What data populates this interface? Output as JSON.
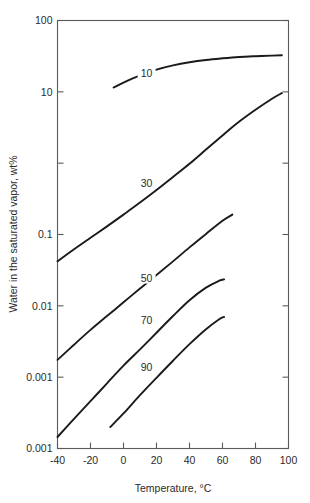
{
  "chart_data": {
    "type": "line",
    "title": "",
    "xlabel": "Temperature, °C",
    "ylabel": "Water in the saturated vapor, wt%",
    "xlim": [
      -40,
      100
    ],
    "ylim": [
      0.0001,
      100
    ],
    "yscale": "log",
    "xscale": "linear",
    "grid": false,
    "legend": "inline-curve-labels",
    "xticks": [
      -40,
      -20,
      0,
      20,
      40,
      60,
      80,
      100
    ],
    "xtick_labels": [
      "-40",
      "-20",
      "0",
      "20",
      "40",
      "60",
      "80",
      "100"
    ],
    "yticks": [
      100,
      10,
      1,
      0.1,
      0.01,
      0.001,
      0.0001
    ],
    "ytick_labels": [
      "100",
      "10",
      "",
      "0.1",
      "0.01",
      "0.001",
      "0.001"
    ],
    "ytick_label_note": "The 1 decade label is blank and the lowest decade is printed as 0.001 in the source figure",
    "series": [
      {
        "name": "10",
        "label": "10",
        "label_x": 14,
        "label_y": 18.0,
        "points": [
          {
            "x": -6,
            "y": 11.5
          },
          {
            "x": 0,
            "y": 13.5
          },
          {
            "x": 10,
            "y": 17.0
          },
          {
            "x": 20,
            "y": 20.5
          },
          {
            "x": 30,
            "y": 23.5
          },
          {
            "x": 40,
            "y": 26.0
          },
          {
            "x": 50,
            "y": 28.0
          },
          {
            "x": 60,
            "y": 29.5
          },
          {
            "x": 70,
            "y": 30.8
          },
          {
            "x": 80,
            "y": 31.6
          },
          {
            "x": 90,
            "y": 32.2
          },
          {
            "x": 96,
            "y": 32.5
          }
        ]
      },
      {
        "name": "30",
        "label": "30",
        "label_x": 14,
        "label_y": 0.52,
        "points": [
          {
            "x": -40,
            "y": 0.042
          },
          {
            "x": -30,
            "y": 0.062
          },
          {
            "x": -20,
            "y": 0.09
          },
          {
            "x": -10,
            "y": 0.13
          },
          {
            "x": 0,
            "y": 0.19
          },
          {
            "x": 10,
            "y": 0.28
          },
          {
            "x": 20,
            "y": 0.42
          },
          {
            "x": 30,
            "y": 0.64
          },
          {
            "x": 40,
            "y": 0.98
          },
          {
            "x": 50,
            "y": 1.55
          },
          {
            "x": 60,
            "y": 2.45
          },
          {
            "x": 70,
            "y": 3.8
          },
          {
            "x": 80,
            "y": 5.6
          },
          {
            "x": 90,
            "y": 8.0
          },
          {
            "x": 96,
            "y": 9.6
          }
        ]
      },
      {
        "name": "50",
        "label": "50",
        "label_x": 14,
        "label_y": 0.0245,
        "points": [
          {
            "x": -40,
            "y": 0.00175
          },
          {
            "x": -30,
            "y": 0.00285
          },
          {
            "x": -20,
            "y": 0.0046
          },
          {
            "x": -10,
            "y": 0.0072
          },
          {
            "x": 0,
            "y": 0.0112
          },
          {
            "x": 10,
            "y": 0.0175
          },
          {
            "x": 20,
            "y": 0.027
          },
          {
            "x": 30,
            "y": 0.042
          },
          {
            "x": 40,
            "y": 0.066
          },
          {
            "x": 50,
            "y": 0.102
          },
          {
            "x": 60,
            "y": 0.156
          },
          {
            "x": 66,
            "y": 0.19
          }
        ]
      },
      {
        "name": "70",
        "label": "70",
        "label_x": 14,
        "label_y": 0.0063,
        "points": [
          {
            "x": -40,
            "y": 0.000145
          },
          {
            "x": -30,
            "y": 0.00026
          },
          {
            "x": -20,
            "y": 0.00046
          },
          {
            "x": -10,
            "y": 0.00082
          },
          {
            "x": 0,
            "y": 0.00145
          },
          {
            "x": 10,
            "y": 0.00245
          },
          {
            "x": 20,
            "y": 0.0042
          },
          {
            "x": 30,
            "y": 0.0072
          },
          {
            "x": 40,
            "y": 0.012
          },
          {
            "x": 50,
            "y": 0.018
          },
          {
            "x": 58,
            "y": 0.0225
          },
          {
            "x": 61,
            "y": 0.0235
          }
        ]
      },
      {
        "name": "90",
        "label": "90",
        "label_x": 14,
        "label_y": 0.00138,
        "points": [
          {
            "x": -8,
            "y": 0.0002
          },
          {
            "x": 0,
            "y": 0.00031
          },
          {
            "x": 10,
            "y": 0.00056
          },
          {
            "x": 20,
            "y": 0.00098
          },
          {
            "x": 30,
            "y": 0.0017
          },
          {
            "x": 40,
            "y": 0.0029
          },
          {
            "x": 50,
            "y": 0.0047
          },
          {
            "x": 58,
            "y": 0.0065
          },
          {
            "x": 61,
            "y": 0.007
          }
        ]
      }
    ]
  }
}
